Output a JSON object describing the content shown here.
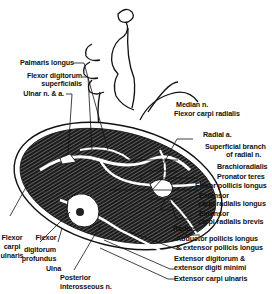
{
  "figure": {
    "labels_left": {
      "palmaris_longus": "Palmaris longus",
      "fds_1": "Flexor digitorum",
      "fds_2": "superficialis",
      "ulnar": "Ulnar n. & a.",
      "fcu_1": "Flexor",
      "fcu_2": "carpi",
      "fcu_3": "ulnaris",
      "fdp_1": "Flexor",
      "fdp_2": "digitorum",
      "fdp_3": "profundus",
      "ulna": "Ulna",
      "pin_1": "Posterior",
      "pin_2": "interosseous n."
    },
    "labels_right": {
      "median": "Median n.",
      "fcr": "Flexor carpi radialis",
      "radial_a": "Radial a.",
      "sbrn_1": "Superficial branch",
      "sbrn_2": "of radial n.",
      "brachioradialis": "Brachioradialis",
      "pronator": "Pronator teres",
      "fpl": "Flexor pollicis longus",
      "ecrl_1": "Extensor",
      "ecrl_2": "carpi radialis longus",
      "ecrb_1": "Extensor",
      "ecrb_2": "carpi radialis brevis",
      "radius": "Radius",
      "apl_1": "Abductor pollicis longus",
      "apl_2": "& extensor pollicis longus",
      "ed_1": "Extensor digitorum &",
      "ed_2": "extensor digiti minimi",
      "ecu": "Extensor carpi ulnaris"
    }
  }
}
